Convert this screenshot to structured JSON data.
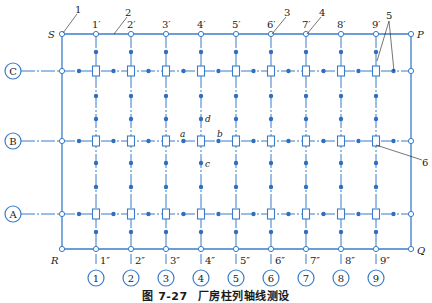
{
  "colors": {
    "line": "#3a7cc8",
    "dot": "#2f6fbd",
    "text": "#1a1a1a",
    "background": "#ffffff"
  },
  "figure": {
    "number": "图 7-27",
    "title": "厂房柱列轴线测设"
  },
  "corners": {
    "S": "S",
    "P": "P",
    "R": "R",
    "Q": "Q"
  },
  "rows": [
    {
      "label": "C",
      "y": 71
    },
    {
      "label": "B",
      "y": 141
    },
    {
      "label": "A",
      "y": 214
    }
  ],
  "columns": [
    {
      "axis": "1",
      "top": "1′",
      "bottom": "1″",
      "x": 96
    },
    {
      "axis": "2",
      "top": "2′",
      "bottom": "2″",
      "x": 131
    },
    {
      "axis": "3",
      "top": "3′",
      "bottom": "3″",
      "x": 166
    },
    {
      "axis": "4",
      "top": "4′",
      "bottom": "4″",
      "x": 201
    },
    {
      "axis": "5",
      "top": "5′",
      "bottom": "5″",
      "x": 236
    },
    {
      "axis": "6",
      "top": "6′",
      "bottom": "6″",
      "x": 271
    },
    {
      "axis": "7",
      "top": "7′",
      "bottom": "7″",
      "x": 306
    },
    {
      "axis": "8",
      "top": "8′",
      "bottom": "8″",
      "x": 341
    },
    {
      "axis": "9",
      "top": "9′",
      "bottom": "9″",
      "x": 376
    }
  ],
  "points": {
    "a": "a",
    "b": "b",
    "c": "c",
    "d": "d"
  },
  "callouts": [
    "1",
    "2",
    "3",
    "4",
    "5",
    "6"
  ]
}
